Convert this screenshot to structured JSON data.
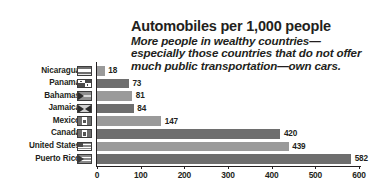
{
  "chart_data": {
    "type": "bar",
    "orientation": "horizontal",
    "title": "Automobiles per 1,000 people",
    "subtitle": "More people in wealthy countries—\nespecially those countries that do not offer\nmuch public transportation—own cars.",
    "xlabel": "",
    "ylabel": "",
    "xlim": [
      0,
      600
    ],
    "xticks": [
      0,
      100,
      200,
      300,
      400,
      500,
      600
    ],
    "grid": false,
    "legend": false,
    "categories": [
      "Nicaragua",
      "Panama",
      "Bahamas",
      "Jamaica",
      "Mexico",
      "Canada",
      "United States",
      "Puerto Rico"
    ],
    "values": [
      18,
      73,
      81,
      84,
      147,
      420,
      439,
      582
    ],
    "bars": [
      {
        "label": "Nicaragua",
        "value": 18,
        "value_text": "18",
        "color": "#9a9a9a",
        "flag": "nicaragua"
      },
      {
        "label": "Panama",
        "value": 73,
        "value_text": "73",
        "color": "#6e6e6e",
        "flag": "panama"
      },
      {
        "label": "Bahamas",
        "value": 81,
        "value_text": "81",
        "color": "#9a9a9a",
        "flag": "bahamas"
      },
      {
        "label": "Jamaica",
        "value": 84,
        "value_text": "84",
        "color": "#6e6e6e",
        "flag": "jamaica"
      },
      {
        "label": "Mexico",
        "value": 147,
        "value_text": "147",
        "color": "#9a9a9a",
        "flag": "mexico"
      },
      {
        "label": "Canada",
        "value": 420,
        "value_text": "420",
        "color": "#6e6e6e",
        "flag": "canada"
      },
      {
        "label": "United States",
        "value": 439,
        "value_text": "439",
        "color": "#9a9a9a",
        "flag": "united-states"
      },
      {
        "label": "Puerto Rico",
        "value": 582,
        "value_text": "582",
        "color": "#6e6e6e",
        "flag": "puerto-rico"
      }
    ],
    "tick_labels": [
      "0",
      "100",
      "200",
      "300",
      "400",
      "500",
      "600"
    ],
    "colors": {
      "bar_light": "#9a9a9a",
      "bar_dark": "#6e6e6e",
      "axis": "#231f20",
      "text": "#231f20",
      "background": "#ffffff"
    }
  }
}
